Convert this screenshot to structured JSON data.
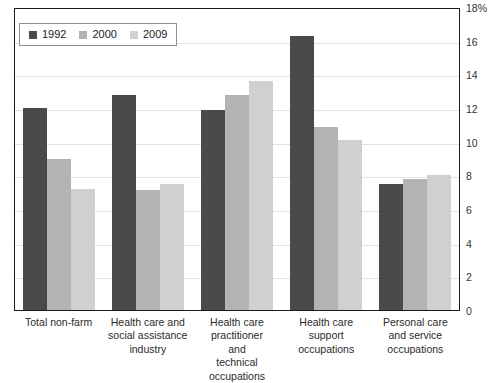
{
  "chart_data": {
    "type": "bar",
    "title": "",
    "xlabel": "",
    "ylabel": "",
    "ylim": [
      0,
      18
    ],
    "ytick_values": [
      18,
      16,
      14,
      12,
      10,
      8,
      6,
      4,
      2,
      0
    ],
    "ytick_labels": [
      "18%",
      "16",
      "14",
      "12",
      "10",
      "8",
      "6",
      "4",
      "2",
      "0"
    ],
    "grid": true,
    "legend_position": "top-left",
    "categories": [
      "Total non-farm",
      "Health care and\nsocial assistance\nindustry",
      "Health care\npractitioner\nand\ntechnical\noccupations",
      "Health care\nsupport\noccupations",
      "Personal care\nand service\noccupations"
    ],
    "series": [
      {
        "name": "1992",
        "color": "#4a4a4a",
        "values": [
          12.0,
          12.8,
          11.9,
          16.3,
          7.5
        ]
      },
      {
        "name": "2000",
        "color": "#b3b3b3",
        "values": [
          9.0,
          7.1,
          12.8,
          10.9,
          7.8
        ]
      },
      {
        "name": "2009",
        "color": "#d0d0d0",
        "values": [
          7.2,
          7.5,
          13.6,
          10.1,
          8.0
        ]
      }
    ]
  },
  "legend": {
    "items": [
      {
        "label": "1992",
        "color": "#4a4a4a"
      },
      {
        "label": "2000",
        "color": "#b3b3b3"
      },
      {
        "label": "2009",
        "color": "#d0d0d0"
      }
    ]
  },
  "axis": {
    "y_ticks": [
      "18%",
      "16",
      "14",
      "12",
      "10",
      "8",
      "6",
      "4",
      "2",
      "0"
    ],
    "x_categories": [
      "Total non-farm",
      "Health care and social assistance industry",
      "Health care practitioner and technical occupations",
      "Health care support occupations",
      "Personal care and service occupations"
    ]
  }
}
